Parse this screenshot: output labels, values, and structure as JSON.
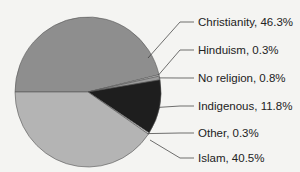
{
  "chart_data": {
    "type": "pie",
    "title": "",
    "slices": [
      {
        "label": "Christianity",
        "value": 46.3,
        "display": "Christianity, 46.3%",
        "color": "#8e8e8e"
      },
      {
        "label": "Hinduism",
        "value": 0.3,
        "display": "Hinduism, 0.3%",
        "color": "#d8d8d8"
      },
      {
        "label": "No religion",
        "value": 0.8,
        "display": "No religion, 0.8%",
        "color": "#9a9a9a"
      },
      {
        "label": "Indigenous",
        "value": 11.8,
        "display": "Indigenous, 11.8%",
        "color": "#1e1e1e"
      },
      {
        "label": "Other",
        "value": 0.3,
        "display": "Other, 0.3%",
        "color": "#e0e0e0"
      },
      {
        "label": "Islam",
        "value": 40.5,
        "display": "Islam, 40.5%",
        "color": "#b4b4b4"
      }
    ],
    "start_angle_deg": 180,
    "direction": "clockwise",
    "legend_position": "right, callout labels with leader lines"
  }
}
